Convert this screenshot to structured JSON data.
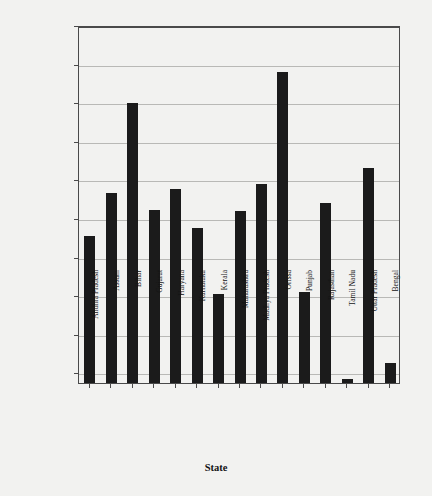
{
  "chart_data": {
    "type": "bar",
    "title": "",
    "xlabel": "State",
    "ylabel": "Agricultural/Industrial Expenditure",
    "ylim": [
      0.0645,
      0.25
    ],
    "yticks": [
      0.25,
      0.23,
      0.21,
      0.19,
      0.17,
      0.15,
      0.13,
      0.11,
      0.09,
      0.07
    ],
    "ytick_labels": [
      "0.25",
      "0.23",
      "0.21",
      "0.19",
      "0.17",
      "0.15",
      "0.13",
      "0.11",
      "0.09",
      "0.07"
    ],
    "grid": true,
    "legend": null,
    "bar_color": "#1b1b1b",
    "background_color": "#f2f2f0",
    "categories": [
      "Andhra Pradesh",
      "Assam",
      "Bihar",
      "Gujarat",
      "Haryana",
      "Karnataka",
      "Kerala",
      "Maharashtra",
      "Madhya Pradesh",
      "Orissa",
      "Punjab",
      "Rajasthan",
      "Tamil Nadu",
      "Uttar Pradesh",
      "Bengal"
    ],
    "values": [
      0.1405,
      0.163,
      0.2095,
      0.154,
      0.165,
      0.145,
      0.1105,
      0.1535,
      0.1675,
      0.2255,
      0.1115,
      0.158,
      0.0665,
      0.176,
      0.075
    ]
  }
}
